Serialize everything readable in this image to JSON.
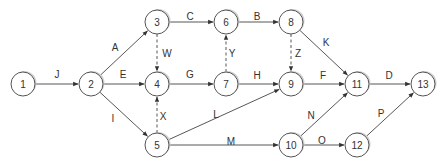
{
  "diagram": {
    "type": "activity-on-arrow network",
    "node_radius": 12,
    "nodes": [
      {
        "id": "1",
        "x": 23,
        "y": 84
      },
      {
        "id": "2",
        "x": 91,
        "y": 84
      },
      {
        "id": "3",
        "x": 157,
        "y": 22
      },
      {
        "id": "4",
        "x": 157,
        "y": 84
      },
      {
        "id": "5",
        "x": 157,
        "y": 145
      },
      {
        "id": "6",
        "x": 226,
        "y": 22
      },
      {
        "id": "7",
        "x": 226,
        "y": 84
      },
      {
        "id": "8",
        "x": 291,
        "y": 22
      },
      {
        "id": "9",
        "x": 291,
        "y": 84
      },
      {
        "id": "10",
        "x": 291,
        "y": 145
      },
      {
        "id": "11",
        "x": 357,
        "y": 84
      },
      {
        "id": "12",
        "x": 357,
        "y": 145
      },
      {
        "id": "13",
        "x": 423,
        "y": 84
      }
    ],
    "edges": [
      {
        "label": "J",
        "from": "1",
        "to": "2",
        "dummy": false,
        "lx": 57,
        "ly": 74
      },
      {
        "label": "A",
        "from": "2",
        "to": "3",
        "dummy": false,
        "lx": 115,
        "ly": 47
      },
      {
        "label": "E",
        "from": "2",
        "to": "4",
        "dummy": false,
        "lx": 123,
        "ly": 74
      },
      {
        "label": "I",
        "from": "2",
        "to": "5",
        "dummy": false,
        "lx": 113,
        "ly": 118
      },
      {
        "label": "C",
        "from": "3",
        "to": "6",
        "dummy": false,
        "lx": 190,
        "ly": 16
      },
      {
        "label": "W",
        "from": "3",
        "to": "4",
        "dummy": true,
        "lx": 167,
        "ly": 53
      },
      {
        "label": "G",
        "from": "4",
        "to": "7",
        "dummy": false,
        "lx": 190,
        "ly": 74
      },
      {
        "label": "X",
        "from": "5",
        "to": "4",
        "dummy": true,
        "lx": 163,
        "ly": 116
      },
      {
        "label": "B",
        "from": "6",
        "to": "8",
        "dummy": false,
        "lx": 257,
        "ly": 16
      },
      {
        "label": "Y",
        "from": "7",
        "to": "6",
        "dummy": true,
        "lx": 232,
        "ly": 53
      },
      {
        "label": "H",
        "from": "7",
        "to": "9",
        "dummy": false,
        "lx": 257,
        "ly": 75
      },
      {
        "label": "Z",
        "from": "8",
        "to": "9",
        "dummy": true,
        "lx": 298,
        "ly": 53
      },
      {
        "label": "K",
        "from": "8",
        "to": "11",
        "dummy": false,
        "lx": 326,
        "ly": 42
      },
      {
        "label": "L",
        "from": "5",
        "to": "9",
        "dummy": false,
        "lx": 216,
        "ly": 114
      },
      {
        "label": "M",
        "from": "5",
        "to": "10",
        "dummy": false,
        "lx": 231,
        "ly": 141
      },
      {
        "label": "F",
        "from": "9",
        "to": "11",
        "dummy": false,
        "lx": 323,
        "ly": 75
      },
      {
        "label": "D",
        "from": "11",
        "to": "13",
        "dummy": false,
        "lx": 389,
        "ly": 75
      },
      {
        "label": "N",
        "from": "10",
        "to": "11",
        "dummy": false,
        "lx": 311,
        "ly": 115
      },
      {
        "label": "O",
        "from": "10",
        "to": "12",
        "dummy": false,
        "lx": 322,
        "ly": 140
      },
      {
        "label": "P",
        "from": "12",
        "to": "13",
        "dummy": false,
        "lx": 381,
        "ly": 113
      }
    ]
  }
}
